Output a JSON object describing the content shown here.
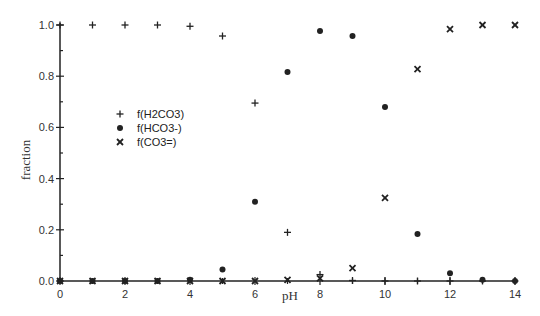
{
  "chart_data": {
    "type": "scatter",
    "title": "",
    "xlabel": "pH",
    "ylabel": "fraction",
    "xlim": [
      0,
      14
    ],
    "ylim": [
      0,
      1.0
    ],
    "x_ticks": [
      0,
      2,
      4,
      6,
      8,
      10,
      12,
      14
    ],
    "x_minor_ticks": [
      1,
      3,
      5,
      7,
      9,
      11,
      13
    ],
    "y_ticks": [
      0.0,
      0.2,
      0.4,
      0.6,
      0.8,
      1.0
    ],
    "y_tick_labels": [
      "0.0",
      "0.2",
      "0.4",
      "0.6",
      "0.8",
      "1.0"
    ],
    "grid": false,
    "legend_position": "upper-left-inside",
    "x": [
      0,
      1,
      2,
      3,
      4,
      5,
      6,
      7,
      8,
      9,
      10,
      11,
      12,
      13,
      14
    ],
    "series": [
      {
        "name": "f(H2CO3)",
        "marker": "plus",
        "values": [
          1.0,
          1.0,
          1.0,
          1.0,
          0.995,
          0.957,
          0.695,
          0.19,
          0.025,
          0.002,
          0.0,
          0.0,
          0.0,
          0.0,
          0.0
        ]
      },
      {
        "name": "f(HCO3-)",
        "marker": "filled-circle",
        "values": [
          0.0,
          0.0,
          0.0,
          0.0,
          0.005,
          0.045,
          0.31,
          0.816,
          0.977,
          0.957,
          0.68,
          0.184,
          0.03,
          0.005,
          0.0
        ]
      },
      {
        "name": "f(CO3=)",
        "marker": "x",
        "values": [
          0.0,
          0.0,
          0.0,
          0.0,
          0.0,
          0.0,
          0.0,
          0.004,
          0.01,
          0.05,
          0.325,
          0.828,
          0.984,
          1.0,
          1.0
        ]
      }
    ]
  },
  "legend": {
    "items": [
      {
        "label": "f(H2CO3)",
        "marker": "plus"
      },
      {
        "label": "f(HCO3-)",
        "marker": "filled-circle"
      },
      {
        "label": "f(CO3=)",
        "marker": "x"
      }
    ]
  }
}
